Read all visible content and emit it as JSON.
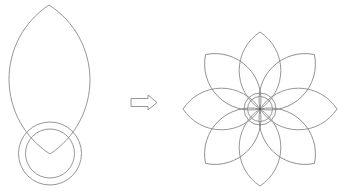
{
  "diagram": {
    "stroke_color": "#8a8a8a",
    "background": "#ffffff",
    "source_shape": {
      "petal": {
        "tip": [
          49,
          5
        ],
        "base": [
          50,
          154
        ],
        "half_width": 40.5
      },
      "circles": {
        "center": [
          50,
          153.5
        ],
        "outer_radius": 31.5,
        "inner_radius": 24.5
      }
    },
    "arrow": {
      "direction": "right",
      "x": [
        131,
        157
      ],
      "y": [
        95,
        110
      ],
      "style": "outline"
    },
    "result_shape": {
      "center": [
        260,
        109
      ],
      "petal_count": 8,
      "petal_length": 77,
      "petal_half_width": 21,
      "circles": {
        "outer_radius": 16,
        "inner_radius": 12.5
      },
      "rotation_step_deg": 45
    }
  }
}
